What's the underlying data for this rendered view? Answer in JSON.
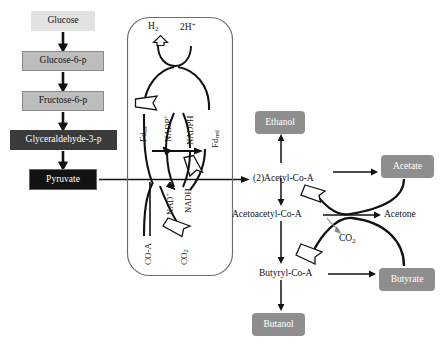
{
  "figure": {
    "background": "#ffffff"
  },
  "colors": {
    "light_gray": "#d9d9d9",
    "mid_gray": "#a6a6a6",
    "gray": "#8c8c8c",
    "dark_gray": "#3f3f3f",
    "black": "#111111",
    "white_text": "#ffffff",
    "dark_text": "#111111",
    "stroke": "#1a1a1a",
    "box_border": "#555555"
  },
  "glycolysis_chain": {
    "name": "glycolysis-column",
    "nodes": [
      {
        "id": "glucose",
        "label": "Glucose",
        "fill": "#e2e2e2",
        "text": "#111111",
        "x": 31,
        "y": 11,
        "w": 64,
        "h": 20,
        "font": 9.5,
        "border": "none"
      },
      {
        "id": "glucose-6-p",
        "label": "Glucose-6-p",
        "fill": "#bdbdbd",
        "text": "#111111",
        "x": 22,
        "y": 51,
        "w": 82,
        "h": 20,
        "font": 9.5,
        "border": "#8a8a8a"
      },
      {
        "id": "fructose-6-p",
        "label": "Fructose-6-p",
        "fill": "#bdbdbd",
        "text": "#111111",
        "x": 22,
        "y": 91,
        "w": 82,
        "h": 20,
        "font": 9.5,
        "border": "#8a8a8a"
      },
      {
        "id": "glyceraldehyde-3-p",
        "label": "Glyceraldehyde-3-p",
        "fill": "#3b3b3b",
        "text": "#ffffff",
        "x": 10,
        "y": 130,
        "w": 107,
        "h": 20,
        "font": 9.5,
        "border": "#2a2a2a"
      },
      {
        "id": "pyruvate",
        "label": "Pyruvate",
        "fill": "#121212",
        "text": "#ffffff",
        "x": 29,
        "y": 169,
        "w": 68,
        "h": 21,
        "font": 9.5,
        "border": "#555555"
      }
    ]
  },
  "cycle_box": {
    "name": "redox-cycle-panel",
    "x": 127,
    "y": 17,
    "w": 106,
    "h": 259,
    "radius": 22,
    "border": "#6e6e6e",
    "fill": "#ffffff",
    "labels": {
      "h2": {
        "text": "H",
        "sub": "2",
        "x": 148,
        "y": 26,
        "font": 9.5
      },
      "two_h_plus": {
        "text": "2H",
        "sup": "+",
        "x": 180,
        "y": 26,
        "font": 9.5
      },
      "fd_ox": {
        "text": "Fd",
        "sub": "ox",
        "x": 139,
        "y": 139,
        "font": 9,
        "rotate": -90
      },
      "fd_red": {
        "text": "Fd",
        "sub": "red",
        "x": 211,
        "y": 143,
        "font": 9,
        "rotate": -90
      },
      "nadp_plus": {
        "text": "NADP",
        "sup": "+",
        "x": 163,
        "y": 114,
        "font": 8.5,
        "rotate": -90
      },
      "nadph": {
        "text": "NADPH",
        "x": 185,
        "y": 116,
        "font": 8.5,
        "rotate": -90
      },
      "nad_plus": {
        "text": "NAD",
        "sup": "+",
        "x": 164,
        "y": 187,
        "font": 8.5,
        "rotate": -90
      },
      "nadh": {
        "text": "NADH",
        "x": 183,
        "y": 186,
        "font": 8.5,
        "rotate": -90
      },
      "co_a": {
        "text": "CO-A",
        "x": 144,
        "y": 247,
        "font": 9,
        "rotate": -90
      },
      "co2": {
        "text": "CO",
        "sub": "2",
        "x": 179,
        "y": 247,
        "font": 9,
        "rotate": -90
      }
    }
  },
  "products": {
    "name": "fermentation-products",
    "boxes": [
      {
        "id": "ethanol",
        "label": "Ethanol",
        "fill": "#8e8e8e",
        "text": "#ffffff",
        "x": 255,
        "y": 111,
        "w": 50,
        "h": 23,
        "font": 9.5,
        "radius": 4
      },
      {
        "id": "acetate",
        "label": "Acetate",
        "fill": "#8e8e8e",
        "text": "#ffffff",
        "x": 381,
        "y": 155,
        "w": 53,
        "h": 23,
        "font": 9.5,
        "radius": 4
      },
      {
        "id": "butyrate",
        "label": "Butyrate",
        "fill": "#8e8e8e",
        "text": "#ffffff",
        "x": 379,
        "y": 268,
        "w": 56,
        "h": 23,
        "font": 9.5,
        "radius": 4
      },
      {
        "id": "butanol",
        "label": "Butanol",
        "fill": "#8e8e8e",
        "text": "#ffffff",
        "x": 252,
        "y": 313,
        "w": 53,
        "h": 23,
        "font": 9.5,
        "radius": 4
      }
    ],
    "intermediates": [
      {
        "id": "acetyl-co-a",
        "label": "(2)Acetyl-Co-A",
        "x": 253,
        "y": 168,
        "font": 9.5
      },
      {
        "id": "acetoacetyl-co-a",
        "label": "Acetoacetyl-Co-A",
        "x": 232,
        "y": 211,
        "font": 9.5
      },
      {
        "id": "acetone",
        "label": "Acetone",
        "x": 385,
        "y": 211,
        "font": 9.5
      },
      {
        "id": "butyryl-co-a",
        "label": "Butyryl-Co-A",
        "x": 259,
        "y": 270,
        "font": 9.5
      },
      {
        "id": "co2-acetone",
        "label": "CO",
        "sub": "2",
        "x": 340,
        "y": 234,
        "font": 9.5
      }
    ]
  },
  "connections": {
    "name": "pathway-arrows",
    "description": "Glycolysis downward arrows, horizontal pyruvate to acetyl-CoA arrow through redox cycle, branching arrows to ethanol, acetate, acetone, butyrate, butanol"
  }
}
